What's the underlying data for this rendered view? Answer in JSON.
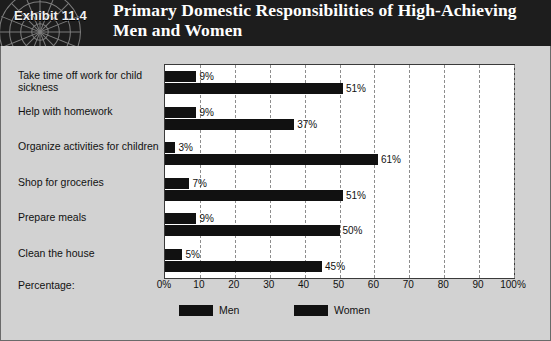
{
  "header": {
    "exhibit_tag": "Exhibit 11.4",
    "title": "Primary Domestic Responsibilities of High-Achieving Men and Women",
    "decoration_icon": "sunburst-icon",
    "background_color": "#1d1d1d",
    "text_color": "#ffffff"
  },
  "panel": {
    "background_color": "#d2d2d2",
    "border_color": "#6a6a6a"
  },
  "chart_data": {
    "type": "bar",
    "orientation": "horizontal",
    "title": "Primary Domestic Responsibilities of High-Achieving Men and Women",
    "xlabel": "Percentage:",
    "ylabel": "",
    "xlim": [
      0,
      100
    ],
    "grid": true,
    "grid_style": "dashed-vertical",
    "legend_position": "bottom",
    "categories": [
      "Take time off work for child sickness",
      "Help with homework",
      "Organize activities for children",
      "Shop for groceries",
      "Prepare meals",
      "Clean the house"
    ],
    "series": [
      {
        "name": "Men",
        "color": "#111111",
        "values": [
          9,
          9,
          3,
          7,
          9,
          5
        ]
      },
      {
        "name": "Women",
        "color": "#111111",
        "values": [
          51,
          37,
          61,
          51,
          50,
          45
        ]
      }
    ],
    "data_labels": {
      "Men": [
        "9%",
        "9%",
        "3%",
        "7%",
        "9%",
        "5%"
      ],
      "Women": [
        "51%",
        "37%",
        "61%",
        "51%",
        "50%",
        "45%"
      ]
    },
    "tick_labels": [
      "0%",
      "10",
      "20",
      "30",
      "40",
      "50",
      "60",
      "70",
      "80",
      "90",
      "100%"
    ],
    "tick_values": [
      0,
      10,
      20,
      30,
      40,
      50,
      60,
      70,
      80,
      90,
      100
    ]
  }
}
